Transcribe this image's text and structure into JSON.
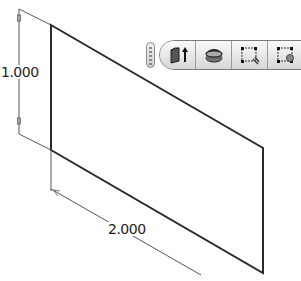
{
  "dimensions": {
    "vertical": {
      "value": "1.000"
    },
    "horizontal": {
      "value": "2.000"
    }
  },
  "toolbar": {
    "buttons": [
      {
        "name": "extrude",
        "icon": "extrude-icon"
      },
      {
        "name": "revolve",
        "icon": "revolve-icon"
      },
      {
        "name": "edit-sketch",
        "icon": "sketch-edit-icon"
      },
      {
        "name": "sketch-point",
        "icon": "sketch-point-icon"
      }
    ]
  },
  "colors": {
    "geometry": "#2a2a2a",
    "dimension_line": "#444444",
    "toolbar_bg": "#e4e4e4"
  }
}
